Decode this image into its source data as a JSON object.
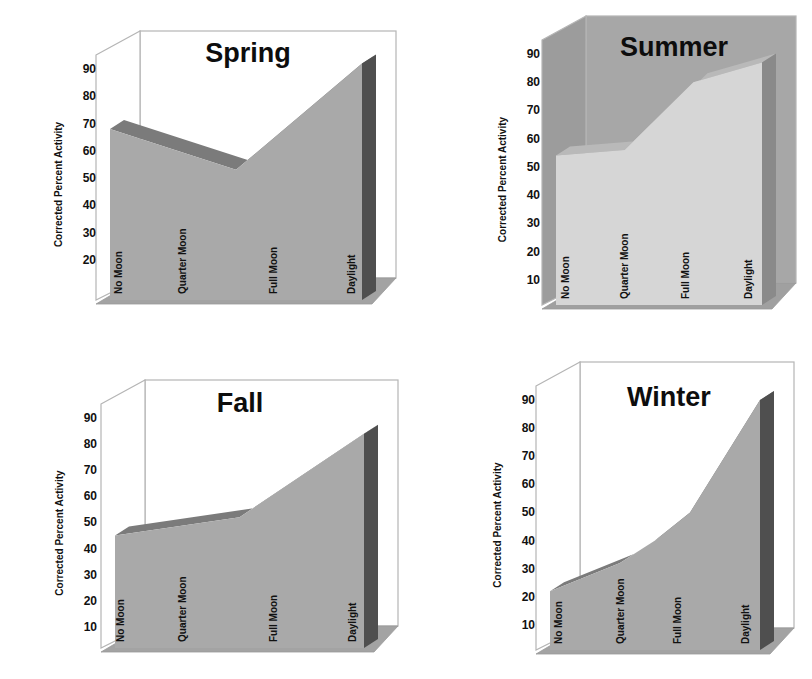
{
  "chart_data": [
    {
      "type": "area",
      "title": "Spring",
      "xlabel": "",
      "ylabel": "Corrected Percent Activity",
      "categories": [
        "No Moon",
        "Quarter Moon",
        "Full Moon",
        "Daylight"
      ],
      "yticks": [
        20,
        30,
        40,
        50,
        60,
        70,
        80,
        90
      ],
      "ylim": [
        10,
        90
      ],
      "grid": false,
      "legend": "none",
      "style": "3d",
      "points": [
        {
          "x": 0.0,
          "y": 68
        },
        {
          "x": 0.5,
          "y": 53
        },
        {
          "x": 1.0,
          "y": 92
        }
      ],
      "values": [
        68,
        59,
        53,
        92
      ],
      "colors": {
        "front": "#a9a9a9",
        "top": "#7b7b7b",
        "side": "#4f4f4f",
        "wall": "#ffffff",
        "floor": "#a3a3a3"
      }
    },
    {
      "type": "area",
      "title": "Summer",
      "xlabel": "",
      "ylabel": "Corrected Percent Activity",
      "categories": [
        "No Moon",
        "Quarter Moon",
        "Full Moon",
        "Daylight"
      ],
      "yticks": [
        10,
        20,
        30,
        40,
        50,
        60,
        70,
        80,
        90
      ],
      "ylim": [
        0,
        90
      ],
      "grid": false,
      "legend": "none",
      "style": "3d",
      "points": [
        {
          "x": 0.0,
          "y": 54
        },
        {
          "x": 0.333,
          "y": 56
        },
        {
          "x": 0.667,
          "y": 80
        },
        {
          "x": 1.0,
          "y": 87
        }
      ],
      "values": [
        54,
        56,
        80,
        87
      ],
      "colors": {
        "front": "#d6d6d6",
        "top": "#b9b9b9",
        "side": "#8a8a8a",
        "wall": "#a7a7a7",
        "floor": "#a0a0a0"
      }
    },
    {
      "type": "area",
      "title": "Fall",
      "xlabel": "",
      "ylabel": "Corrected Percent Activity",
      "categories": [
        "No Moon",
        "Quarter Moon",
        "Full Moon",
        "Daylight"
      ],
      "yticks": [
        10,
        20,
        30,
        40,
        50,
        60,
        70,
        80,
        90
      ],
      "ylim": [
        0,
        90
      ],
      "grid": false,
      "legend": "none",
      "style": "3d",
      "points": [
        {
          "x": 0.0,
          "y": 45
        },
        {
          "x": 0.5,
          "y": 52
        },
        {
          "x": 1.0,
          "y": 84
        }
      ],
      "values": [
        45,
        49,
        54,
        84
      ],
      "colors": {
        "front": "#a9a9a9",
        "top": "#7b7b7b",
        "side": "#4f4f4f",
        "wall": "#ffffff",
        "floor": "#a3a3a3"
      }
    },
    {
      "type": "area",
      "title": "Winter",
      "xlabel": "",
      "ylabel": "Corrected Percent Activity",
      "categories": [
        "No Moon",
        "Quarter Moon",
        "Full Moon",
        "Daylight"
      ],
      "yticks": [
        10,
        20,
        30,
        40,
        50,
        60,
        70,
        80,
        90
      ],
      "ylim": [
        0,
        90
      ],
      "grid": false,
      "legend": "none",
      "style": "3d",
      "points": [
        {
          "x": 0.0,
          "y": 22
        },
        {
          "x": 0.333,
          "y": 32
        },
        {
          "x": 0.5,
          "y": 40
        },
        {
          "x": 0.667,
          "y": 50
        },
        {
          "x": 1.0,
          "y": 90
        }
      ],
      "values": [
        22,
        32,
        50,
        90
      ],
      "colors": {
        "front": "#a9a9a9",
        "top": "#7b7b7b",
        "side": "#4f4f4f",
        "wall": "#ffffff",
        "floor": "#a3a3a3"
      }
    }
  ],
  "layout": [
    {
      "left": 40,
      "top": 20,
      "plotX": 110,
      "plotRight": 362,
      "plotBottom": 300,
      "yMinPx": 287,
      "yMaxPx": 69,
      "axisX": 96,
      "titleX": 248,
      "titleY": 62,
      "catX": [
        122,
        186,
        277,
        355
      ]
    },
    {
      "left": 480,
      "top": 20,
      "plotX": 556,
      "plotRight": 762,
      "plotBottom": 305,
      "yMinPx": 308,
      "yMaxPx": 54,
      "axisX": 540,
      "titleX": 674,
      "titleY": 56,
      "catX": [
        569,
        628,
        689,
        752
      ]
    },
    {
      "left": 40,
      "top": 370,
      "plotX": 115,
      "plotRight": 364,
      "plotBottom": 648,
      "yMinPx": 653,
      "yMaxPx": 418,
      "axisX": 97,
      "titleX": 240,
      "titleY": 412,
      "catX": [
        124,
        186,
        277,
        356
      ]
    },
    {
      "left": 480,
      "top": 370,
      "plotX": 550,
      "plotRight": 760,
      "plotBottom": 650,
      "yMinPx": 653,
      "yMaxPx": 400,
      "axisX": 535,
      "titleX": 669,
      "titleY": 406,
      "catX": [
        562,
        624,
        681,
        749
      ]
    }
  ]
}
